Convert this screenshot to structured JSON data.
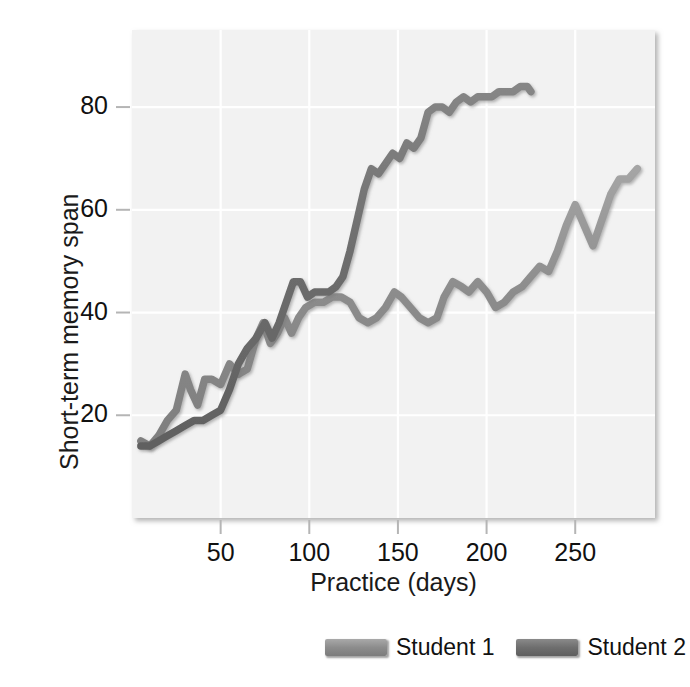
{
  "chart_data": {
    "type": "line",
    "title": "",
    "subtitle": "",
    "xlabel": "Practice (days)",
    "ylabel": "Short-term memory span",
    "xlim": [
      0,
      295
    ],
    "ylim": [
      0,
      95
    ],
    "xticks": [
      50,
      100,
      150,
      200,
      250
    ],
    "yticks": [
      20,
      40,
      60,
      80
    ],
    "grid": true,
    "legend_position": "below-right",
    "plot_bgcolor": "#f2f2f2",
    "grid_color": "#ffffff",
    "series": [
      {
        "name": "Student 1",
        "color": "#8c8c8c",
        "x": [
          5,
          10,
          15,
          20,
          25,
          30,
          33,
          37,
          41,
          45,
          50,
          55,
          60,
          65,
          70,
          74,
          78,
          82,
          86,
          90,
          94,
          98,
          103,
          108,
          113,
          118,
          123,
          128,
          133,
          138,
          143,
          148,
          152,
          157,
          162,
          167,
          172,
          176,
          181,
          186,
          190,
          195,
          200,
          205,
          210,
          215,
          220,
          225,
          230,
          235,
          240,
          245,
          250,
          255,
          260,
          265,
          270,
          275,
          280,
          285
        ],
        "y": [
          15,
          14,
          16,
          19,
          21,
          28,
          25,
          22,
          27,
          27,
          26,
          30,
          28,
          29,
          35,
          38,
          34,
          36,
          39,
          36,
          39,
          41,
          42,
          42,
          43,
          43,
          42,
          39,
          38,
          39,
          41,
          44,
          43,
          41,
          39,
          38,
          39,
          43,
          46,
          45,
          44,
          46,
          44,
          41,
          42,
          44,
          45,
          47,
          49,
          48,
          52,
          57,
          61,
          57,
          53,
          58,
          63,
          66,
          66,
          68
        ],
        "y_start": 15,
        "y_end": 68
      },
      {
        "name": "Student 2",
        "color": "#6e6e6e",
        "x": [
          5,
          10,
          15,
          20,
          25,
          30,
          35,
          40,
          45,
          50,
          55,
          60,
          65,
          70,
          75,
          79,
          83,
          87,
          91,
          95,
          99,
          103,
          107,
          111,
          115,
          119,
          123,
          127,
          131,
          135,
          139,
          143,
          147,
          151,
          155,
          159,
          163,
          167,
          171,
          175,
          179,
          183,
          187,
          191,
          195,
          199,
          203,
          207,
          211,
          215,
          219,
          223,
          225
        ],
        "y": [
          14,
          14,
          15,
          16,
          17,
          18,
          19,
          19,
          20,
          21,
          25,
          30,
          33,
          35,
          38,
          35,
          38,
          42,
          46,
          46,
          43,
          44,
          44,
          44,
          45,
          47,
          52,
          58,
          64,
          68,
          67,
          69,
          71,
          70,
          73,
          72,
          74,
          79,
          80,
          80,
          79,
          81,
          82,
          81,
          82,
          82,
          82,
          83,
          83,
          83,
          84,
          84,
          83
        ],
        "y_start": 14,
        "y_end": 83
      }
    ]
  },
  "axes": {
    "ylabel": "Short-term memory span",
    "xlabel": "Practice (days)",
    "ytick_labels": [
      "20",
      "40",
      "60",
      "80"
    ],
    "xtick_labels": [
      "50",
      "100",
      "150",
      "200",
      "250"
    ]
  },
  "legend": {
    "entries": [
      {
        "label": "Student 1",
        "color": "#8c8c8c"
      },
      {
        "label": "Student 2",
        "color": "#6e6e6e"
      }
    ]
  }
}
